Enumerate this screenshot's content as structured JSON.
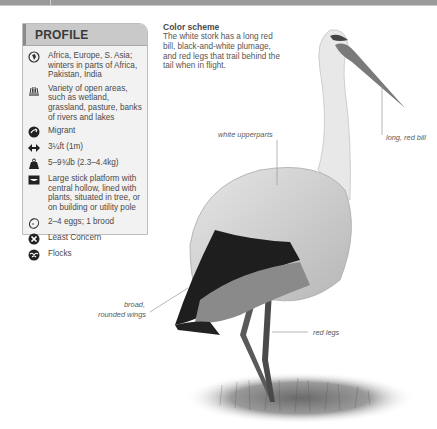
{
  "profile": {
    "title": "PROFILE",
    "rows": [
      {
        "icon": "globe-icon",
        "text": "Africa, Europe, S. Asia; winters in parts of Africa, Pakistan, India"
      },
      {
        "icon": "grass-habitat-icon",
        "text": "Variety of open areas, such as wetland, grassland, pasture, banks of rivers and lakes"
      },
      {
        "icon": "migrant-icon",
        "text": "Migrant"
      },
      {
        "icon": "wingspan-icon",
        "text": "3¼ft (1m)"
      },
      {
        "icon": "weight-icon",
        "text": "5–9¾lb (2.3–4.4kg)"
      },
      {
        "icon": "nest-icon",
        "text": "Large stick platform with central hollow, lined with plants, situated in tree, or on building or utility pole"
      },
      {
        "icon": "egg-icon",
        "text": "2–4 eggs; 1 brood"
      },
      {
        "icon": "conservation-status-icon",
        "text": "Least Concern"
      },
      {
        "icon": "social-flock-icon",
        "text": "Flocks"
      }
    ]
  },
  "color_scheme": {
    "title": "Color scheme",
    "body": "The white stork has a long red bill, black-and-white plumage, and red legs that trail behind the tail when in flight."
  },
  "annotations": {
    "white_upperparts": "white upperparts",
    "long_red_bill": "long, red bill",
    "broad_wings_line1": "broad,",
    "broad_wings_line2": "rounded wings",
    "red_legs": "red legs"
  },
  "colors": {
    "profile_bg": "#f2f2f2",
    "profile_header": "#c9c9c9",
    "text": "#4a4a4a"
  }
}
